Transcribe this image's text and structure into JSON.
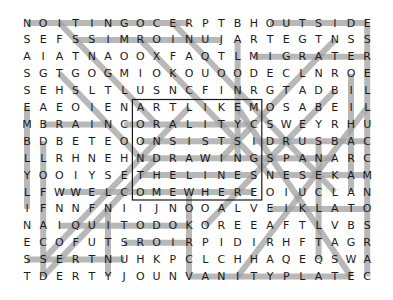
{
  "puzzle": {
    "title": "",
    "grid": [
      "NOITINGOCERPTBHOUTSIDE",
      "SEFSSIMROINUJARTEGTNSS",
      "AIATNAOOXFAQTLMIGRATER",
      "SGTGOGMIOKOUOODECLNROE",
      "SEHSLTLUSNCFINRGTADBIL",
      "EAEOIENARTLIKEMOSABEIL",
      "MBRAINCORALITYCSWEYRHU",
      "BDBETEOONSISTSIDRUSBAC",
      "LLRHNEHNDRAWINGSPANARC",
      "YOOIYSETHELINESNESEKAM",
      "LFWWELCOMEWHEREOIUCLAN",
      "IFNNFNIIJNOOALVEIKLATO",
      "NAIQUITODOKOREEAFTLVBS",
      "ECOFUTSROIRPIDIRHFTAGR",
      "SSERTNUHKPCLCHHAQEQSWA",
      "TDERTYJOUNVANITYPLATEC"
    ],
    "rows": 16,
    "cols": 22,
    "highlight_color": "#a0a0a0",
    "box": {
      "row_start": 5,
      "row_end": 10,
      "col_start": 7,
      "col_end": 14
    },
    "highlights": [
      [
        0,
        0,
        0,
        10
      ],
      [
        0,
        15,
        0,
        21
      ],
      [
        1,
        3,
        1,
        12
      ],
      [
        2,
        14,
        2,
        21
      ],
      [
        6,
        1,
        6,
        5
      ],
      [
        6,
        6,
        6,
        14
      ],
      [
        7,
        7,
        7,
        13
      ],
      [
        7,
        14,
        7,
        21
      ],
      [
        8,
        7,
        8,
        15
      ],
      [
        8,
        15,
        8,
        19
      ],
      [
        9,
        7,
        9,
        14
      ],
      [
        9,
        15,
        9,
        21
      ],
      [
        10,
        2,
        10,
        14
      ],
      [
        11,
        15,
        11,
        21
      ],
      [
        12,
        2,
        12,
        10
      ],
      [
        13,
        6,
        13,
        10
      ],
      [
        14,
        0,
        14,
        6
      ],
      [
        15,
        10,
        15,
        20
      ],
      [
        5,
        0,
        11,
        0
      ],
      [
        0,
        21,
        15,
        21
      ],
      [
        7,
        1,
        15,
        1
      ],
      [
        3,
        20,
        10,
        20
      ],
      [
        1,
        13,
        8,
        13
      ],
      [
        7,
        18,
        14,
        18
      ],
      [
        10,
        10,
        15,
        10
      ],
      [
        11,
        5,
        15,
        5
      ],
      [
        0,
        2,
        6,
        8
      ],
      [
        1,
        7,
        9,
        15
      ],
      [
        0,
        9,
        10,
        19
      ],
      [
        5,
        13,
        15,
        20
      ],
      [
        15,
        1,
        8,
        8
      ],
      [
        14,
        1,
        5,
        10
      ],
      [
        12,
        11,
        4,
        19
      ],
      [
        15,
        13,
        5,
        21
      ],
      [
        3,
        2,
        8,
        7
      ],
      [
        1,
        19,
        8,
        12
      ]
    ]
  }
}
